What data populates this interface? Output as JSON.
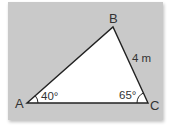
{
  "diagram": {
    "type": "triangle",
    "vertices": [
      {
        "name": "A",
        "x": 27,
        "y": 103
      },
      {
        "name": "B",
        "x": 113,
        "y": 27
      },
      {
        "name": "C",
        "x": 148,
        "y": 103
      }
    ],
    "labels": {
      "A": "A",
      "B": "B",
      "C": "C",
      "side_BC": "4 m",
      "angle_A": "40°",
      "angle_C": "65°"
    },
    "colors": {
      "background": "#c9c9c9",
      "triangle_fill": "#ffffff",
      "stroke": "#222222"
    }
  }
}
